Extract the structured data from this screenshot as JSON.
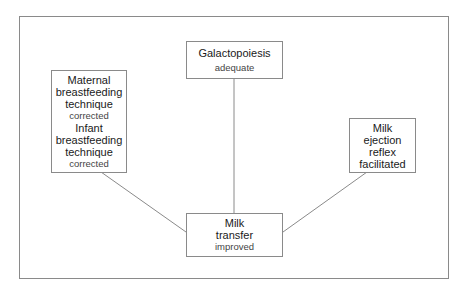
{
  "nodes": {
    "galactopoiesis": {
      "title": "Galactopoiesis",
      "status": "adequate"
    },
    "maternal": {
      "title_lines": [
        "Maternal",
        "breastfeeding",
        "technique"
      ],
      "status": "corrected"
    },
    "infant": {
      "title_lines": [
        "Infant",
        "breastfeeding",
        "technique"
      ],
      "status": "corrected"
    },
    "ejection": {
      "title_lines": [
        "Milk",
        "ejection",
        "reflex",
        "facilitated"
      ]
    },
    "transfer": {
      "title_lines": [
        "Milk",
        "transfer"
      ],
      "status": "improved"
    }
  },
  "colors": {
    "line": "#8a8a8a",
    "border": "#8a8a8a"
  }
}
